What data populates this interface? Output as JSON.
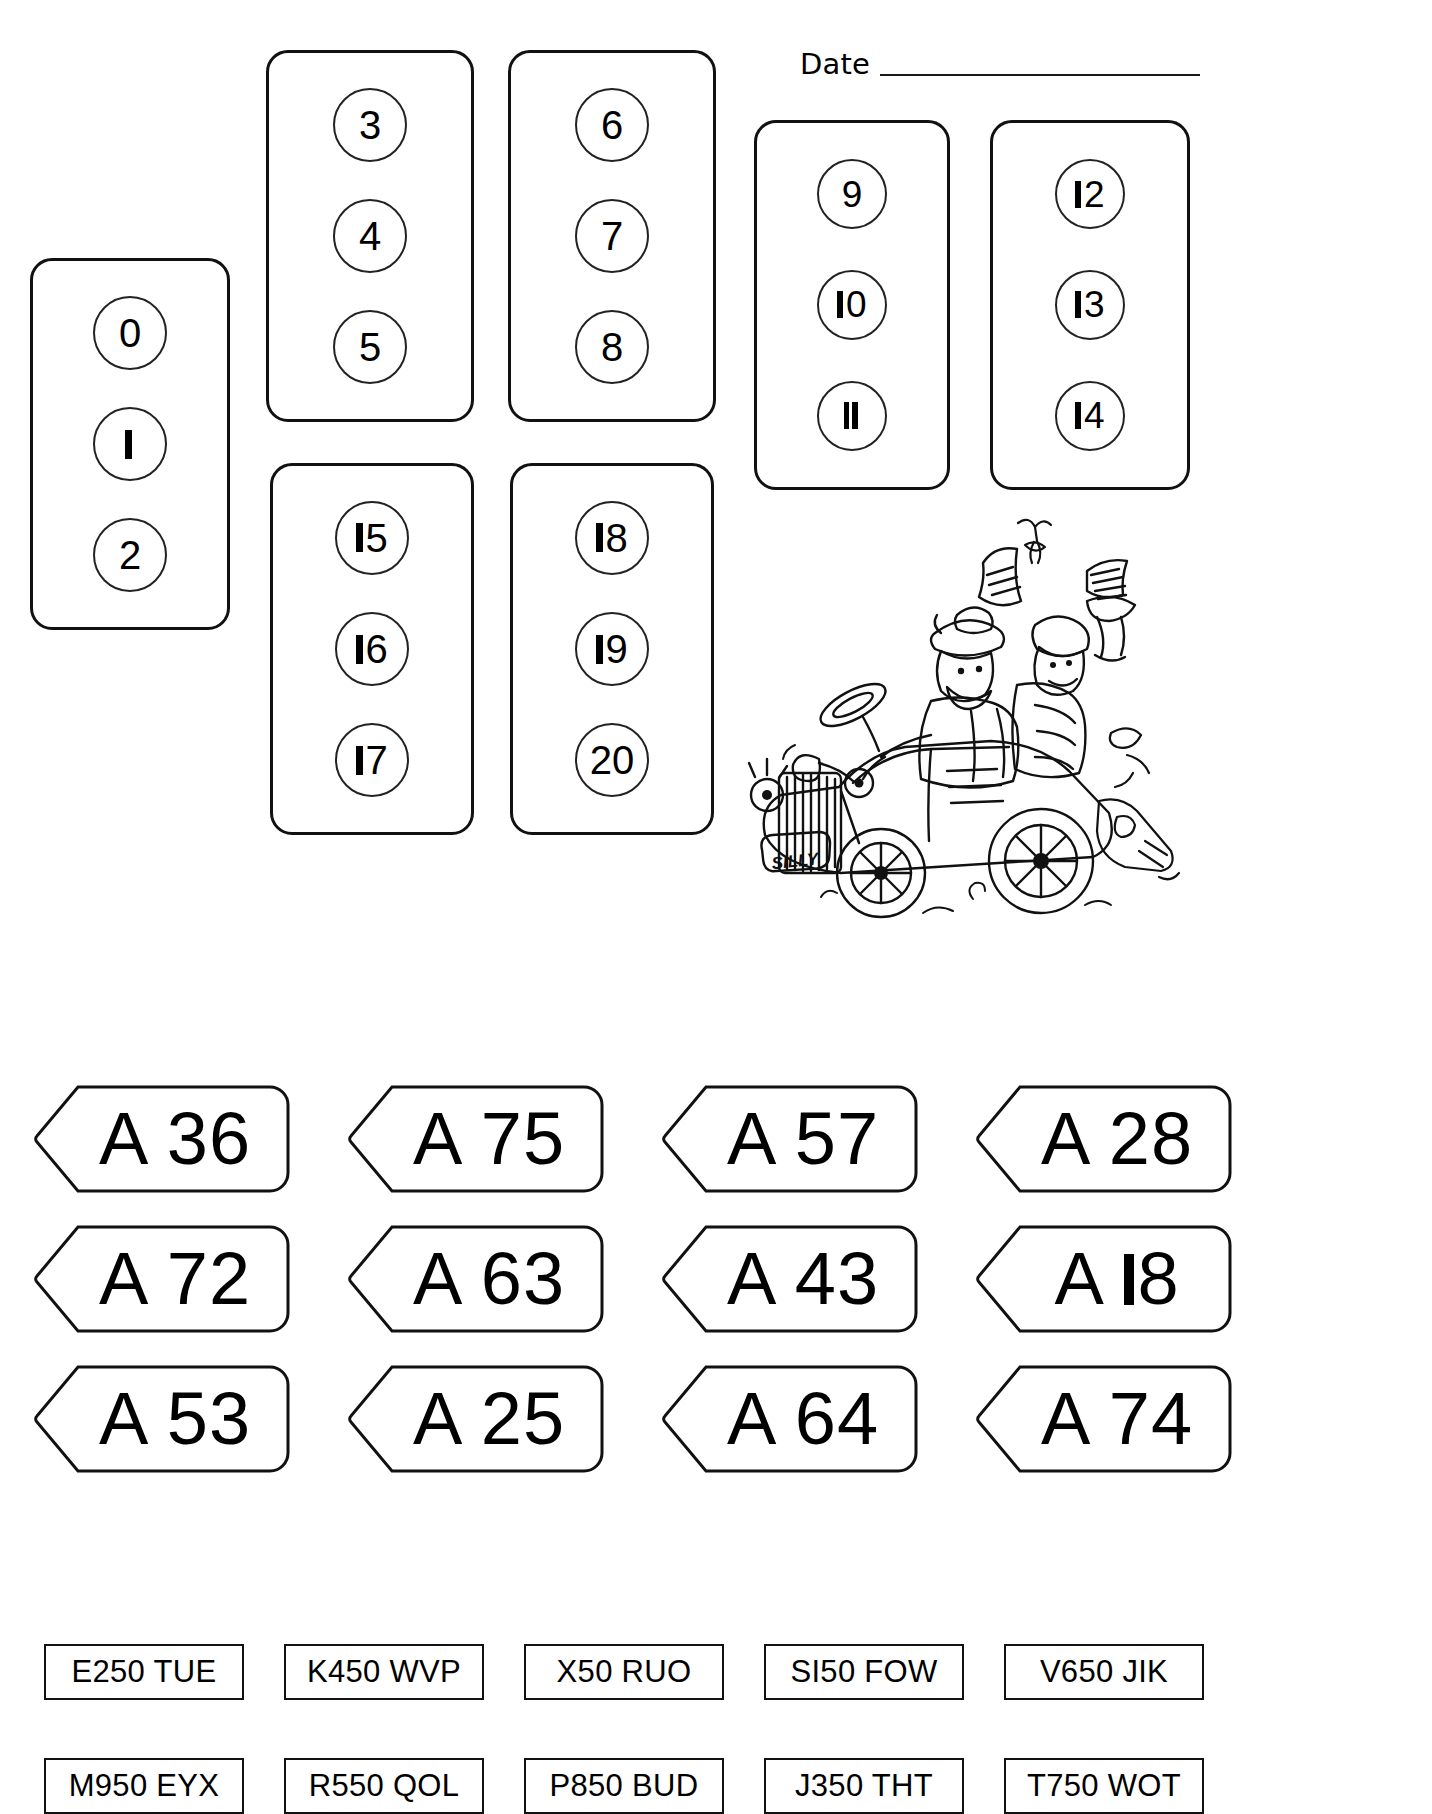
{
  "page": {
    "background_color": "#ffffff",
    "ink_color": "#000000"
  },
  "header": {
    "date_label": "Date",
    "date_value": ""
  },
  "number_cards": [
    {
      "id": "card-0-2",
      "numbers": [
        "0",
        "1",
        "2"
      ]
    },
    {
      "id": "card-3-5",
      "numbers": [
        "3",
        "4",
        "5"
      ]
    },
    {
      "id": "card-6-8",
      "numbers": [
        "6",
        "7",
        "8"
      ]
    },
    {
      "id": "card-9-11",
      "numbers": [
        "9",
        "10",
        "11"
      ]
    },
    {
      "id": "card-12-14",
      "numbers": [
        "12",
        "13",
        "14"
      ]
    },
    {
      "id": "card-15-17",
      "numbers": [
        "15",
        "16",
        "17"
      ]
    },
    {
      "id": "card-18-20",
      "numbers": [
        "18",
        "19",
        "20"
      ]
    }
  ],
  "illustration": {
    "name": "cartoon-car-with-passengers",
    "description": "Hand drawn cartoon of a vintage open-top car crowded with cheering passengers wearing hats, a bird flying above",
    "plate_text": "SILLY"
  },
  "road_signs": {
    "rows": [
      [
        "A 36",
        "A 75",
        "A 57",
        "A 28"
      ],
      [
        "A 72",
        "A 63",
        "A 43",
        "A 18"
      ],
      [
        "A 53",
        "A 25",
        "A 64",
        "A 74"
      ]
    ]
  },
  "registration_plates": {
    "rows": [
      [
        "E250 TUE",
        "K450 WVP",
        "X50 RUO",
        "SI50 FOW",
        "V650 JIK"
      ],
      [
        "M950 EYX",
        "R550 QOL",
        "P850 BUD",
        "J350 THT",
        "T750 WOT"
      ]
    ]
  }
}
